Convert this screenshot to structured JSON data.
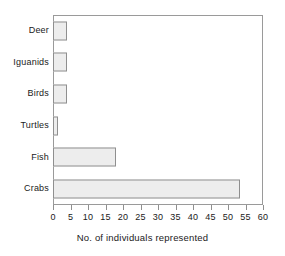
{
  "chart_data": {
    "type": "bar",
    "orientation": "horizontal",
    "title": "",
    "xlabel": "No. of individuals represented",
    "ylabel": "",
    "categories": [
      "Deer",
      "Iguanids",
      "Birds",
      "Turtles",
      "Fish",
      "Crabs"
    ],
    "values": [
      4,
      4,
      4,
      1.5,
      18,
      53.5
    ],
    "xlim": [
      0,
      60
    ],
    "xticks": [
      0,
      5,
      10,
      15,
      20,
      25,
      30,
      35,
      40,
      45,
      50,
      55,
      60
    ],
    "xtick_labels": [
      "0",
      "5",
      "10",
      "15",
      "20",
      "25",
      "30",
      "35",
      "40",
      "45",
      "50",
      "55",
      "60"
    ],
    "grid": false,
    "legend": null,
    "bar_fill_color": "#ededed",
    "bar_edge_color": "#8f8f8f",
    "frame_color": "#9a9a9a",
    "background_color": "#ffffff",
    "text_color": "#1a1a1a"
  }
}
